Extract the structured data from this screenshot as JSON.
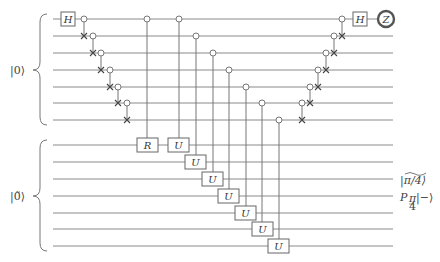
{
  "diagram": {
    "type": "quantum-circuit",
    "registers": [
      {
        "label": "|0⟩",
        "wires": 7,
        "wire_y": [
          19,
          36,
          53,
          70,
          87,
          103,
          120
        ]
      },
      {
        "label": "|0̃⟩",
        "wires": 7,
        "wire_y": [
          145,
          162,
          179,
          196,
          213,
          229,
          246
        ]
      }
    ],
    "gates": {
      "h_left": "H",
      "h_right": "H",
      "measure": "Z",
      "r_gate": "R",
      "u_gate": "U"
    },
    "u_gates": [
      {
        "x": 179,
        "ctrl_y": 19,
        "target_y": 145
      },
      {
        "x": 196,
        "ctrl_y": 36,
        "target_y": 162
      },
      {
        "x": 213,
        "ctrl_y": 53,
        "target_y": 179
      },
      {
        "x": 229,
        "ctrl_y": 70,
        "target_y": 196
      },
      {
        "x": 246,
        "ctrl_y": 87,
        "target_y": 213
      },
      {
        "x": 262,
        "ctrl_y": 103,
        "target_y": 229
      },
      {
        "x": 279,
        "ctrl_y": 120,
        "target_y": 246
      }
    ],
    "left_cascade": [
      {
        "x": 84,
        "ctrl_y": 19,
        "x_y": 36
      },
      {
        "x": 93,
        "ctrl_y": 36,
        "x_y": 53
      },
      {
        "x": 101,
        "ctrl_y": 53,
        "x_y": 70
      },
      {
        "x": 110,
        "ctrl_y": 70,
        "x_y": 87
      },
      {
        "x": 118,
        "ctrl_y": 87,
        "x_y": 103
      },
      {
        "x": 127,
        "ctrl_y": 103,
        "x_y": 120
      }
    ],
    "right_cascade": [
      {
        "x": 302,
        "ctrl_y": 103,
        "x_y": 120
      },
      {
        "x": 310,
        "ctrl_y": 87,
        "x_y": 103
      },
      {
        "x": 318,
        "ctrl_y": 70,
        "x_y": 87
      },
      {
        "x": 326,
        "ctrl_y": 53,
        "x_y": 70
      },
      {
        "x": 334,
        "ctrl_y": 36,
        "x_y": 53
      },
      {
        "x": 342,
        "ctrl_y": 19,
        "x_y": 36
      }
    ],
    "output_labels": {
      "pi4_state": "|π/4⟩",
      "p_op": "P",
      "p_sub_num": "π",
      "p_sub_den": "4",
      "minus_state": "|−⟩"
    }
  }
}
